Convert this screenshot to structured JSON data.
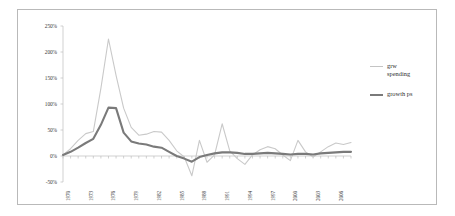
{
  "chart_data": {
    "type": "line",
    "title": "",
    "xlabel": "",
    "ylabel": "",
    "ylim": [
      -50,
      250
    ],
    "ytick_labels": [
      "250%",
      "200%",
      "150%",
      "100%",
      "50%",
      "0%",
      "-50%"
    ],
    "ytick_values": [
      250,
      200,
      150,
      100,
      50,
      0,
      -50
    ],
    "grid": false,
    "legend_position": "right",
    "xlim": [
      1970,
      2008
    ],
    "xtick_labels": [
      "1970",
      "1973",
      "1976",
      "1979",
      "1982",
      "1985",
      "1988",
      "1991",
      "1994",
      "1997",
      "2000",
      "2003",
      "2006"
    ],
    "xtick_values": [
      1970,
      1973,
      1976,
      1979,
      1982,
      1985,
      1988,
      1991,
      1994,
      1997,
      2000,
      2003,
      2006
    ],
    "x": [
      1970,
      1971,
      1972,
      1973,
      1974,
      1975,
      1976,
      1977,
      1978,
      1979,
      1980,
      1981,
      1982,
      1983,
      1984,
      1985,
      1986,
      1987,
      1988,
      1989,
      1990,
      1991,
      1992,
      1993,
      1994,
      1995,
      1996,
      1997,
      1998,
      1999,
      2000,
      2001,
      2002,
      2003,
      2004,
      2005,
      2006,
      2007,
      2008
    ],
    "series": [
      {
        "name": "grw spending",
        "color": "#c9c9c9",
        "width": 1.1,
        "values": [
          2,
          14,
          30,
          43,
          47,
          130,
          225,
          155,
          92,
          55,
          40,
          42,
          47,
          46,
          30,
          10,
          -2,
          -38,
          30,
          -12,
          2,
          62,
          10,
          -5,
          -16,
          2,
          12,
          18,
          14,
          2,
          -9,
          30,
          8,
          -2,
          8,
          18,
          25,
          22,
          26
        ]
      },
      {
        "name": "growth ps",
        "color": "#7a7a7a",
        "width": 2.1,
        "values": [
          2,
          8,
          16,
          25,
          33,
          60,
          93,
          92,
          45,
          28,
          24,
          22,
          18,
          16,
          8,
          0,
          -5,
          -11,
          -2,
          2,
          5,
          7,
          7,
          6,
          4,
          4,
          5,
          6,
          5,
          4,
          3,
          4,
          4,
          3,
          5,
          6,
          7,
          8,
          8
        ]
      }
    ],
    "legend_entries": [
      {
        "label": "grw\nspending",
        "color": "#c4c4c4",
        "style": "thin"
      },
      {
        "label": "growth ps",
        "color": "#7a7a7a",
        "style": "thick"
      }
    ]
  },
  "figure": {
    "border_color": "#b9b9b9",
    "background": "#ffffff"
  }
}
